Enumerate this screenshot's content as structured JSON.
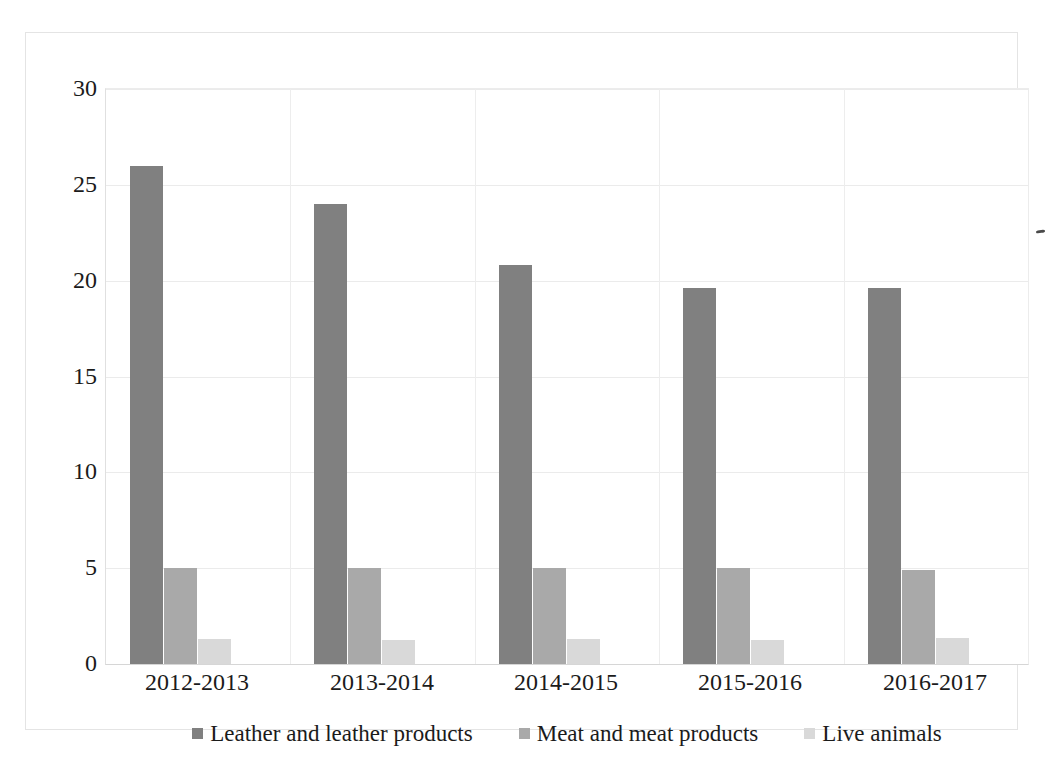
{
  "chart_data": {
    "type": "bar",
    "title": "",
    "subtitle": "",
    "xlabel": "",
    "ylabel": "",
    "ylim": [
      0,
      30
    ],
    "yticks": [
      0,
      5,
      10,
      15,
      20,
      25,
      30
    ],
    "ytick_labels": [
      "0",
      "5",
      "10",
      "15",
      "20",
      "25",
      "30"
    ],
    "grid": true,
    "legend_position": "bottom",
    "categories": [
      "2012-2013",
      "2013-2014",
      "2014-2015",
      "2015-2016",
      "2016-2017"
    ],
    "series": [
      {
        "name": "Leather and leather products",
        "color": "#808080",
        "values": [
          26.0,
          24.0,
          20.8,
          19.6,
          19.6
        ]
      },
      {
        "name": "Meat and meat products",
        "color": "#a9a9a9",
        "values": [
          5.0,
          5.0,
          5.0,
          5.0,
          4.9
        ]
      },
      {
        "name": "Live animals",
        "color": "#d9d9d9",
        "values": [
          1.3,
          1.25,
          1.3,
          1.25,
          1.35
        ]
      }
    ]
  },
  "figure": {
    "background_color": "#ffffff",
    "border_color": "#e4e4e4",
    "gridline_color": "#ebebeb"
  }
}
